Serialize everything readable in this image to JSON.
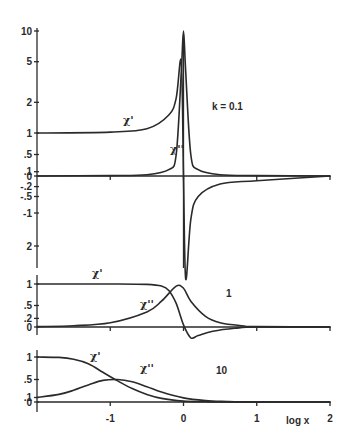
{
  "chart_data": [
    {
      "type": "line",
      "panel": "k=0.1",
      "annotation": "k = 0.1",
      "xlabel": "log x",
      "xlim": [
        -2,
        2
      ],
      "x_ticks": [
        -2,
        -1,
        0,
        1,
        2
      ],
      "y_ticks_upper": [
        "10",
        "5",
        "2",
        "1",
        ".5",
        ".1",
        "0"
      ],
      "y_ticks_lower": [
        "-.2",
        "-.5",
        "-1",
        "2"
      ],
      "y_scale": "nonlinear (compressed)",
      "series": [
        {
          "name": "χ'",
          "x": [
            -2,
            -1,
            -0.5,
            -0.2,
            -0.1,
            -0.03,
            0,
            0.03,
            0.1,
            0.2,
            0.5,
            1,
            2
          ],
          "y": [
            1,
            1.02,
            1.1,
            1.5,
            2.2,
            5,
            0,
            -3,
            -1.2,
            -0.5,
            -0.12,
            -0.02,
            0
          ]
        },
        {
          "name": "χ''",
          "x": [
            -2,
            -1,
            -0.5,
            -0.2,
            -0.1,
            -0.03,
            0,
            0.03,
            0.1,
            0.2,
            0.5,
            1,
            2
          ],
          "y": [
            0,
            0.01,
            0.03,
            0.15,
            0.5,
            4,
            10,
            4,
            0.5,
            0.15,
            0.03,
            0.01,
            0
          ]
        }
      ],
      "labels": [
        "χ'",
        "χ''"
      ]
    },
    {
      "type": "line",
      "panel": "k=1",
      "annotation": "1",
      "xlim": [
        -2,
        2
      ],
      "y_ticks": [
        "1",
        ".5",
        ".2",
        "0"
      ],
      "series": [
        {
          "name": "χ'",
          "x": [
            -2,
            -1,
            -0.5,
            -0.3,
            -0.2,
            -0.1,
            0,
            0.1,
            0.2,
            0.4,
            0.7,
            1,
            2
          ],
          "y": [
            1,
            1,
            0.99,
            0.95,
            0.85,
            0.55,
            0.05,
            -0.25,
            -0.2,
            -0.1,
            -0.03,
            0,
            0
          ]
        },
        {
          "name": "χ''",
          "x": [
            -2,
            -1.5,
            -1,
            -0.5,
            -0.3,
            -0.1,
            0,
            0.1,
            0.3,
            0.5,
            0.8,
            1,
            2
          ],
          "y": [
            0.01,
            0.03,
            0.1,
            0.35,
            0.6,
            0.95,
            0.9,
            0.6,
            0.25,
            0.1,
            0.03,
            0.01,
            0
          ]
        }
      ],
      "labels": [
        "χ'",
        "χ''"
      ]
    },
    {
      "type": "line",
      "panel": "k=10",
      "annotation": "10",
      "xlim": [
        -2,
        2
      ],
      "y_ticks": [
        "1",
        ".5",
        ".1",
        "0"
      ],
      "series": [
        {
          "name": "χ'",
          "x": [
            -2,
            -1.7,
            -1.5,
            -1.3,
            -1.1,
            -0.9,
            -0.7,
            -0.5,
            -0.3,
            0,
            0.3,
            0.6,
            1,
            2
          ],
          "y": [
            1,
            0.99,
            0.95,
            0.85,
            0.66,
            0.47,
            0.3,
            0.17,
            0.08,
            0.02,
            0.005,
            0,
            0,
            0
          ]
        },
        {
          "name": "χ''",
          "x": [
            -2,
            -1.7,
            -1.5,
            -1.3,
            -1.1,
            -0.9,
            -0.7,
            -0.5,
            -0.3,
            0,
            0.3,
            0.6,
            1,
            2
          ],
          "y": [
            0.1,
            0.17,
            0.26,
            0.38,
            0.48,
            0.5,
            0.45,
            0.34,
            0.22,
            0.09,
            0.03,
            0.01,
            0,
            0
          ]
        }
      ],
      "labels": [
        "χ'",
        "χ''"
      ]
    }
  ],
  "x_tick_labels": [
    "-1",
    "0",
    "1",
    "2"
  ],
  "xlabel": "log x"
}
